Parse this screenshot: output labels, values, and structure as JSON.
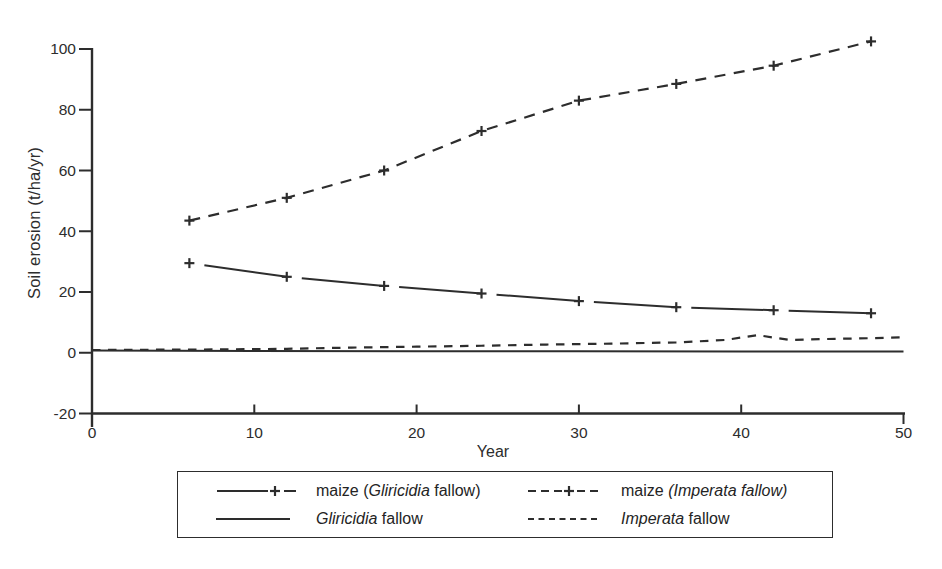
{
  "figure": {
    "background": "#ffffff",
    "ink_color": "#2d2d2d"
  },
  "chart_data": {
    "type": "line",
    "title": "",
    "xlabel": "Year",
    "ylabel": "Soil erosion (t/ha/yr)",
    "xlim": [
      0,
      50
    ],
    "ylim": [
      -20,
      100
    ],
    "xticks": [
      0,
      10,
      20,
      30,
      40,
      50
    ],
    "yticks": [
      -20,
      0,
      20,
      40,
      60,
      80,
      100
    ],
    "grid": false,
    "legend_position": "bottom",
    "series": [
      {
        "name": "maize (Gliricidia fallow)",
        "slug": "maize-gliricidia-fallow",
        "line": "solid-broken",
        "marker": "plus",
        "x": [
          6,
          12,
          18,
          24,
          30,
          36,
          42,
          48
        ],
        "y": [
          29.5,
          25,
          22,
          19.5,
          17,
          15,
          14,
          13
        ]
      },
      {
        "name": "maize (Imperata fallow)",
        "slug": "maize-imperata-fallow",
        "line": "dashed",
        "marker": "plus",
        "x": [
          6,
          12,
          18,
          24,
          30,
          36,
          42,
          48
        ],
        "y": [
          43.5,
          51,
          60,
          73,
          83,
          88.5,
          94.5,
          102.5
        ]
      },
      {
        "name": "Gliricidia fallow",
        "slug": "gliricidia-fallow",
        "line": "solid",
        "marker": "none",
        "x": [
          0,
          10,
          20,
          30,
          40,
          50
        ],
        "y": [
          0.7,
          0.6,
          0.5,
          0.5,
          0.4,
          0.4
        ]
      },
      {
        "name": "Imperata fallow",
        "slug": "imperata-fallow",
        "line": "dashed",
        "marker": "none",
        "x": [
          0,
          4,
          8,
          12,
          16,
          20,
          24,
          28,
          32,
          36,
          39,
          41,
          43,
          45,
          48,
          50
        ],
        "y": [
          0.9,
          1.0,
          1.1,
          1.3,
          1.7,
          2.0,
          2.3,
          2.7,
          3.0,
          3.4,
          4.2,
          5.8,
          4.2,
          4.5,
          4.8,
          5.1
        ]
      }
    ],
    "legend": [
      {
        "series": 0,
        "parts": [
          {
            "text": "maize ("
          },
          {
            "text": "Gliricidia",
            "italic": true
          },
          {
            "text": " fallow)"
          }
        ]
      },
      {
        "series": 1,
        "parts": [
          {
            "text": "maize "
          },
          {
            "text": "(Imperata fallow)",
            "italic": true
          }
        ]
      },
      {
        "series": 2,
        "parts": [
          {
            "text": "Gliricidia",
            "italic": true
          },
          {
            "text": " fallow"
          }
        ]
      },
      {
        "series": 3,
        "parts": [
          {
            "text": "Imperata",
            "italic": true
          },
          {
            "text": " fallow"
          }
        ]
      }
    ]
  }
}
